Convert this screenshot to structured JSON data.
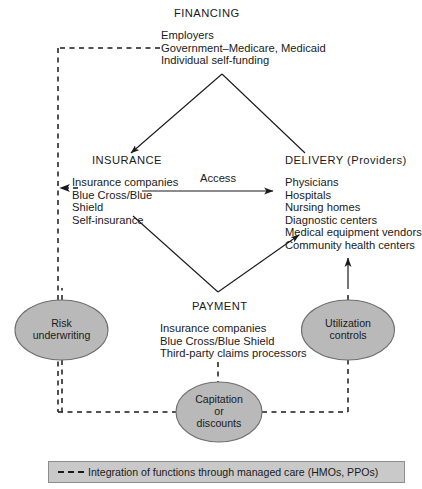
{
  "diagram": {
    "financing": {
      "heading": "FINANCING",
      "items": [
        "Employers",
        "Government–Medicare, Medicaid",
        "Individual self-funding"
      ]
    },
    "insurance": {
      "heading": "INSURANCE",
      "items": [
        "Insurance companies",
        "Blue Cross/Blue",
        "Shield",
        "Self-insurance"
      ]
    },
    "delivery": {
      "heading": "DELIVERY (Providers)",
      "items": [
        "Physicians",
        "Hospitals",
        "Nursing homes",
        "Diagnostic centers",
        "Medical equipment vendors",
        "Community health centers"
      ]
    },
    "payment": {
      "heading": "PAYMENT",
      "items": [
        "Insurance companies",
        "Blue Cross/Blue Shield",
        "Third-party claims processors"
      ]
    },
    "edge_labels": {
      "access": "Access"
    },
    "ovals": [
      {
        "id": "risk-underwriting",
        "label": "Risk\nunderwriting"
      },
      {
        "id": "utilization-controls",
        "label": "Utilization\ncontrols"
      },
      {
        "id": "capitation-or-discounts",
        "label": "Capitation\nor\ndiscounts"
      }
    ],
    "legend": {
      "dash_style": "dashed",
      "text": "Integration of functions through managed care (HMOs, PPOs)"
    },
    "colors": {
      "oval_fill": "#b9b9b9",
      "oval_stroke": "#6e6e6e",
      "legend_fill": "#c9c9c9",
      "legend_stroke": "#8d8d8d",
      "line": "#1a1a1a",
      "text": "#1a1a1a"
    }
  }
}
